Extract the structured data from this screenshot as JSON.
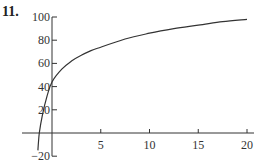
{
  "problem": {
    "number": "11."
  },
  "chart_data": {
    "type": "line",
    "title": "",
    "xlabel": "",
    "ylabel": "",
    "xlim": [
      -2,
      20.5
    ],
    "ylim": [
      -20,
      100
    ],
    "xticks": [
      5,
      10,
      15,
      20
    ],
    "xtick_labels": [
      "5",
      "10",
      "15",
      "20"
    ],
    "yticks": [
      -20,
      20,
      40,
      60,
      80,
      100
    ],
    "ytick_labels": [
      "−20",
      "20",
      "40",
      "60",
      "80",
      "100"
    ],
    "grid": false,
    "legend": null,
    "series": [
      {
        "name": "f(x)",
        "x": [
          -1.45,
          -1.3,
          -1.0,
          -0.5,
          0,
          1,
          2,
          3,
          4,
          5,
          7.5,
          10,
          12.5,
          15,
          17.5,
          20
        ],
        "y": [
          -15,
          0,
          15,
          32,
          44,
          55,
          62,
          67,
          71,
          74,
          81,
          86,
          90,
          93,
          96,
          98
        ]
      }
    ],
    "style": {
      "line_color": "#333333",
      "axis_color": "#333333"
    }
  }
}
